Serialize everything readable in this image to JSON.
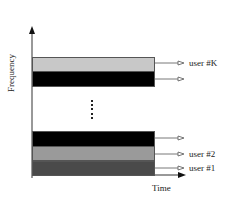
{
  "diagram": {
    "y_axis_label": "Frequency",
    "x_axis_label": "Time",
    "ellipsis": "⋮",
    "bands": [
      {
        "id": "user-k",
        "color": "#c8c8c8",
        "label": "user #K"
      },
      {
        "id": "unlabeled-top",
        "color": "#000000",
        "label": ""
      },
      {
        "id": "unlabeled-bottom",
        "color": "#000000",
        "label": ""
      },
      {
        "id": "user-2",
        "color": "#9a9a9a",
        "label": "user #2"
      },
      {
        "id": "user-1",
        "color": "#4a4a4a",
        "label": "user #1"
      }
    ]
  }
}
